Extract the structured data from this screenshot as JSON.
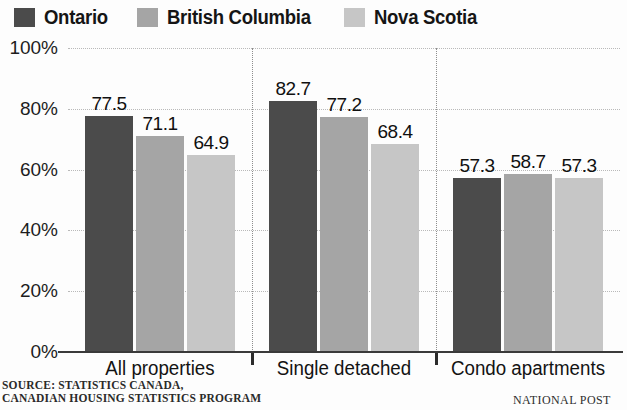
{
  "legend": {
    "entries": [
      {
        "label": "Ontario",
        "color": "#4b4b4b"
      },
      {
        "label": "British Columbia",
        "color": "#a5a5a5"
      },
      {
        "label": "Nova Scotia",
        "color": "#c6c6c6"
      }
    ]
  },
  "axis": {
    "y_ticks": [
      "0%",
      "20%",
      "40%",
      "60%",
      "80%",
      "100%"
    ]
  },
  "footer": {
    "source_line1": "SOURCE: STATISTICS CANADA,",
    "source_line2": "CANADIAN HOUSING STATISTICS PROGRAM",
    "credit": "NATIONAL POST"
  },
  "chart_data": {
    "type": "bar",
    "title": "",
    "xlabel": "",
    "ylabel": "",
    "ylim": [
      0,
      100
    ],
    "yticks": [
      0,
      20,
      40,
      60,
      80,
      100
    ],
    "ytick_labels": [
      "0%",
      "20%",
      "40%",
      "60%",
      "80%",
      "100%"
    ],
    "grid": true,
    "legend_position": "top-left",
    "categories": [
      "All properties",
      "Single detached",
      "Condo apartments"
    ],
    "series": [
      {
        "name": "Ontario",
        "color": "#4b4b4b",
        "values": [
          77.5,
          71.1,
          57.3
        ]
      },
      {
        "name": "British Columbia",
        "color": "#a5a5a5",
        "values": [
          71.1,
          77.2,
          58.7
        ]
      },
      {
        "name": "Nova Scotia",
        "color": "#c6c6c6",
        "values": [
          64.9,
          68.4,
          57.3
        ]
      }
    ],
    "value_labels": [
      [
        "77.5",
        "71.1",
        "64.9"
      ],
      [
        "82.7",
        "77.2",
        "68.4"
      ],
      [
        "57.3",
        "58.7",
        "57.3"
      ]
    ],
    "group_values": [
      [
        77.5,
        71.1,
        64.9
      ],
      [
        82.7,
        77.2,
        68.4
      ],
      [
        57.3,
        58.7,
        57.3
      ]
    ]
  }
}
